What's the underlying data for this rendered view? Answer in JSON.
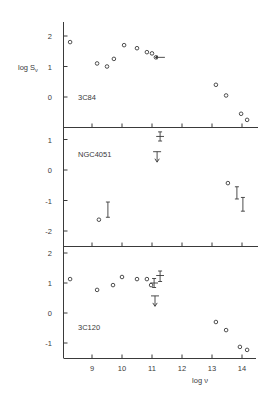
{
  "chart_data": {
    "type": "scatter",
    "title": "",
    "xlabel": "log ν",
    "ylabel": "log Sν",
    "xlim": [
      8.1,
      14.5
    ],
    "x_ticks": [
      9,
      10,
      11,
      12,
      13,
      14
    ],
    "grid": false,
    "legend": "none",
    "colors": {
      "ink": "#3a3a3a",
      "background": "#ffffff"
    },
    "panels": [
      {
        "name": "3C84",
        "ylim": [
          -1,
          2.45
        ],
        "y_ticks": [
          2,
          1,
          0
        ],
        "y_tick_labels": [
          "2",
          "1",
          "0"
        ],
        "points": [
          {
            "x": 8.27,
            "y": 1.8
          },
          {
            "x": 9.17,
            "y": 1.1
          },
          {
            "x": 9.5,
            "y": 1.0
          },
          {
            "x": 9.73,
            "y": 1.25
          },
          {
            "x": 10.07,
            "y": 1.7
          },
          {
            "x": 10.5,
            "y": 1.6
          },
          {
            "x": 10.83,
            "y": 1.47
          },
          {
            "x": 11.0,
            "y": 1.43
          },
          {
            "x": 11.13,
            "y": 1.3
          },
          {
            "x": 13.13,
            "y": 0.4
          },
          {
            "x": 13.47,
            "y": 0.05
          },
          {
            "x": 13.97,
            "y": -0.55
          },
          {
            "x": 14.17,
            "y": -0.75
          }
        ],
        "error_bars": [],
        "upper_limits": [],
        "arrows": [
          {
            "x": 11.13,
            "y": 1.3,
            "direction": "right"
          }
        ]
      },
      {
        "name": "NGC4051",
        "ylim": [
          -2.5,
          1.4
        ],
        "y_ticks": [
          1,
          0,
          -1,
          -2
        ],
        "y_tick_labels": [
          "1",
          "0",
          "-1",
          "-2"
        ],
        "points": [
          {
            "x": 9.23,
            "y": -1.63
          },
          {
            "x": 13.53,
            "y": -0.43
          }
        ],
        "error_bars": [
          {
            "x": 9.53,
            "y": -1.3,
            "ylo": -1.55,
            "yhi": -1.05,
            "xerr": 0
          },
          {
            "x": 11.27,
            "y": 1.1,
            "ylo": 0.95,
            "yhi": 1.25,
            "xerr": 0.13
          },
          {
            "x": 13.83,
            "y": -0.75,
            "ylo": -0.95,
            "yhi": -0.55,
            "xerr": 0
          },
          {
            "x": 14.03,
            "y": -1.1,
            "ylo": -1.35,
            "yhi": -0.9,
            "xerr": 0
          }
        ],
        "upper_limits": [
          {
            "x": 11.17,
            "y": 0.6
          }
        ],
        "arrows": []
      },
      {
        "name": "3C120",
        "ylim": [
          -1.5,
          2.2
        ],
        "y_ticks": [
          2,
          1,
          0,
          -1
        ],
        "y_tick_labels": [
          "2",
          "1",
          "0",
          "-1"
        ],
        "points": [
          {
            "x": 8.27,
            "y": 1.13
          },
          {
            "x": 9.17,
            "y": 0.77
          },
          {
            "x": 9.7,
            "y": 0.93
          },
          {
            "x": 10.0,
            "y": 1.2
          },
          {
            "x": 10.5,
            "y": 1.13
          },
          {
            "x": 10.83,
            "y": 1.13
          },
          {
            "x": 10.97,
            "y": 0.93
          },
          {
            "x": 13.13,
            "y": -0.3
          },
          {
            "x": 13.47,
            "y": -0.57
          },
          {
            "x": 13.93,
            "y": -1.13
          },
          {
            "x": 14.17,
            "y": -1.23
          }
        ],
        "error_bars": [
          {
            "x": 11.07,
            "y": 1.0,
            "ylo": 0.85,
            "yhi": 1.15,
            "xerr": 0.13
          },
          {
            "x": 11.27,
            "y": 1.25,
            "ylo": 1.05,
            "yhi": 1.4,
            "xerr": 0.13
          }
        ],
        "upper_limits": [
          {
            "x": 11.1,
            "y": 0.57
          }
        ],
        "arrows": []
      }
    ]
  },
  "labels": {
    "ylabel_main": "log S",
    "ylabel_sub": "ν",
    "xlabel_main": "log ν",
    "panel_3c84": "3C84",
    "panel_ngc4051": "NGC4051",
    "panel_3c120": "3C120",
    "xtick_9": "9",
    "xtick_10": "10",
    "xtick_11": "11",
    "xtick_12": "12",
    "xtick_13": "13",
    "xtick_14": "14"
  }
}
